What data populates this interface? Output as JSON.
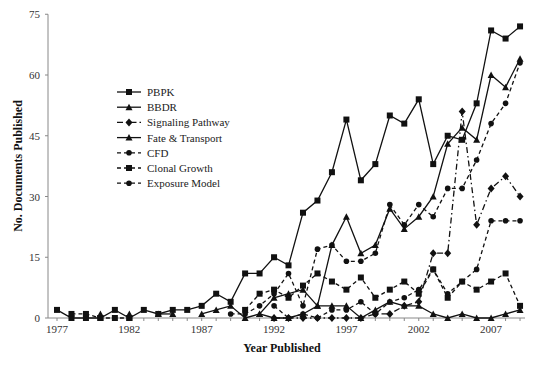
{
  "chart_data": {
    "type": "line",
    "title": "",
    "xlabel": "Year Published",
    "ylabel": "No. Documents Published",
    "ylim": [
      0,
      75
    ],
    "yticks": [
      0,
      15,
      30,
      45,
      60,
      75
    ],
    "xlim": [
      1977,
      2009
    ],
    "xticks": [
      1977,
      1982,
      1987,
      1992,
      1997,
      2002,
      2007
    ],
    "grid": false,
    "legend_position": "upper-left-inside",
    "x": [
      1977,
      1978,
      1979,
      1980,
      1981,
      1982,
      1983,
      1984,
      1985,
      1986,
      1987,
      1988,
      1989,
      1990,
      1991,
      1992,
      1993,
      1994,
      1995,
      1996,
      1997,
      1998,
      1999,
      2000,
      2001,
      2002,
      2003,
      2004,
      2005,
      2006,
      2007,
      2008,
      2009
    ],
    "series": [
      {
        "name": "PBPK",
        "marker": "square",
        "dash": "solid",
        "values": [
          2,
          0,
          0,
          0,
          2,
          0,
          2,
          1,
          2,
          2,
          3,
          6,
          4,
          11,
          11,
          15,
          13,
          26,
          29,
          36,
          49,
          34,
          38,
          50,
          48,
          54,
          38,
          45,
          44,
          53,
          71,
          69,
          72
        ]
      },
      {
        "name": "BBDR",
        "marker": "triangle",
        "dash": "solid",
        "values": [
          null,
          null,
          null,
          1,
          null,
          1,
          null,
          1,
          1,
          null,
          1,
          2,
          3,
          0,
          1,
          5,
          6,
          7,
          3,
          18,
          25,
          16,
          18,
          27,
          22,
          25,
          30,
          43,
          47,
          44,
          60,
          57,
          64
        ]
      },
      {
        "name": "Signaling Pathway",
        "marker": "diamond",
        "dash": "dashdot",
        "values": [
          null,
          null,
          null,
          null,
          null,
          null,
          null,
          null,
          null,
          null,
          null,
          null,
          null,
          null,
          null,
          0,
          0,
          0,
          0,
          0,
          0,
          0,
          1,
          1,
          3,
          4,
          16,
          16,
          51,
          23,
          32,
          35,
          30
        ]
      },
      {
        "name": "Fate & Transport",
        "marker": "triangle",
        "dash": "solid",
        "values": [
          null,
          null,
          null,
          null,
          null,
          null,
          null,
          null,
          null,
          null,
          null,
          null,
          null,
          null,
          1,
          0,
          0,
          1,
          3,
          3,
          3,
          0,
          2,
          4,
          3,
          3,
          1,
          0,
          1,
          0,
          0,
          1,
          2
        ]
      },
      {
        "name": "CFD",
        "marker": "circle",
        "dash": "dashed",
        "values": [
          null,
          null,
          null,
          null,
          null,
          null,
          null,
          null,
          null,
          null,
          null,
          null,
          null,
          null,
          null,
          3,
          0,
          1,
          0,
          2,
          2,
          4,
          1,
          4,
          5,
          7,
          12,
          6,
          9,
          12,
          24,
          24,
          24
        ]
      },
      {
        "name": "Clonal Growth",
        "marker": "square",
        "dash": "dashed",
        "values": [
          null,
          1,
          1,
          0,
          0,
          0,
          null,
          null,
          null,
          null,
          null,
          null,
          null,
          2,
          6,
          7,
          5,
          8,
          11,
          9,
          7,
          10,
          5,
          7,
          9,
          6,
          12,
          5,
          9,
          7,
          9,
          11,
          3
        ]
      },
      {
        "name": "Exposure Model",
        "marker": "circle",
        "dash": "dashed",
        "values": [
          null,
          null,
          null,
          null,
          null,
          null,
          null,
          null,
          null,
          null,
          null,
          null,
          1,
          1,
          3,
          6,
          11,
          3,
          17,
          18,
          14,
          14,
          16,
          28,
          23,
          28,
          25,
          32,
          32,
          39,
          48,
          53,
          63
        ]
      }
    ]
  },
  "axes": {
    "xlabel": "Year Published",
    "ylabel": "No. Documents Published",
    "yticks": [
      "0",
      "15",
      "30",
      "45",
      "60",
      "75"
    ],
    "xticks": [
      "1977",
      "1982",
      "1987",
      "1992",
      "1997",
      "2002",
      "2007"
    ]
  },
  "legend": [
    {
      "label": "PBPK",
      "marker": "square",
      "dash": "solid"
    },
    {
      "label": "BBDR",
      "marker": "triangle",
      "dash": "solid"
    },
    {
      "label": "Signaling Pathway",
      "marker": "diamond",
      "dash": "dashdot"
    },
    {
      "label": "Fate & Transport",
      "marker": "triangle",
      "dash": "solid"
    },
    {
      "label": "CFD",
      "marker": "circle",
      "dash": "dashed"
    },
    {
      "label": "Clonal Growth",
      "marker": "square",
      "dash": "dashed"
    },
    {
      "label": "Exposure Model",
      "marker": "circle",
      "dash": "dashed"
    }
  ],
  "colors": {
    "line": "#111111",
    "axis": "#888888",
    "text": "#222222"
  }
}
